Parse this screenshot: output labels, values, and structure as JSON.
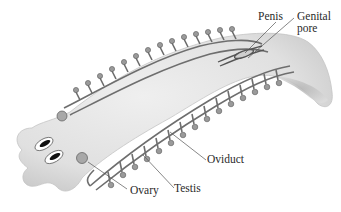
{
  "figure": {
    "labels": {
      "penis": "Penis",
      "genital_pore": "Genital\npore",
      "oviduct": "Oviduct",
      "testis": "Testis",
      "ovary": "Ovary"
    }
  },
  "colors": {
    "background": "#ffffff",
    "body_fill": "#e4e4e4",
    "body_shadow": "#bdbdbd",
    "duct": "#6e6e6e",
    "text": "#2a2a2a",
    "leader_line": "#555555"
  }
}
